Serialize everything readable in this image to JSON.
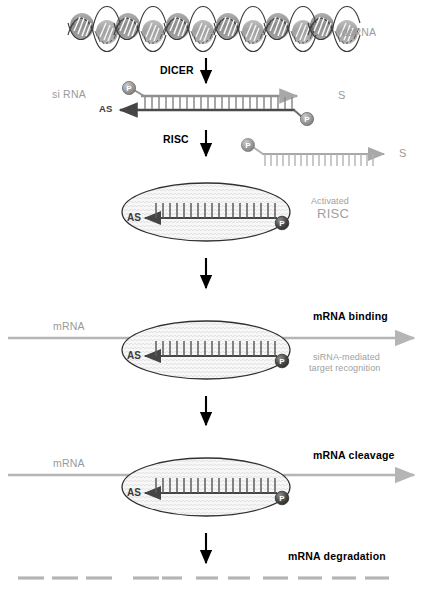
{
  "figure": {
    "type": "biological-pathway-diagram",
    "background_color": "#ffffff"
  },
  "colors": {
    "black": "#000000",
    "gray_label": "#9a9a9a",
    "gray_light": "#b8b8b8",
    "strand_dark": "#4a4a4a",
    "strand_gray": "#9a9a9a",
    "risc_dome": "#2a2a2a",
    "risc_body_fill": "#f2f2f2",
    "mrna_line": "#b5b5b5"
  },
  "labels": {
    "dsrna": "dsRNA",
    "dicer": "DICER",
    "sirna": "si RNA",
    "risc": "RISC",
    "activated_line1": "Activated",
    "activated_line2": "RISC",
    "mrna_1": "mRNA",
    "mrna_2": "mRNA",
    "mrna_binding": "mRNA binding",
    "target_recognition_line1": "siRNA-mediated",
    "target_recognition_line2": "target recognition",
    "mrna_cleavage": "mRNA cleavage",
    "mrna_degradation": "mRNA degradation"
  },
  "strand_labels": {
    "sense_top": "S",
    "antisense_top": "AS",
    "sense_released": "S",
    "antisense_risc1": "AS",
    "antisense_risc2": "AS",
    "antisense_risc3": "AS",
    "phosphate": "P"
  },
  "steps": [
    {
      "id": "dsrna",
      "label": "dsRNA",
      "description": "Long double-stranded RNA helices"
    },
    {
      "id": "dicer",
      "label": "DICER",
      "description": "Dicer enzyme cleaves dsRNA into siRNA duplex"
    },
    {
      "id": "sirna",
      "label": "si RNA",
      "description": "21-nt siRNA duplex with 5' phosphates, sense (S) and antisense (AS) strands"
    },
    {
      "id": "risc",
      "label": "RISC",
      "description": "RISC loading; sense strand released"
    },
    {
      "id": "activated-risc",
      "label": "Activated RISC",
      "description": "Activated RISC carrying the antisense guide strand"
    },
    {
      "id": "mrna-binding",
      "label": "mRNA binding",
      "description": "siRNA-mediated target recognition of mRNA"
    },
    {
      "id": "mrna-cleavage",
      "label": "mRNA cleavage",
      "description": "Target mRNA cleaved by RISC"
    },
    {
      "id": "mrna-degradation",
      "label": "mRNA degradation",
      "description": "Cleaved mRNA fragments degraded"
    }
  ],
  "counts": {
    "dsrna_helices": 6,
    "sirna_base_pairs": 22,
    "degradation_fragments": 11
  }
}
